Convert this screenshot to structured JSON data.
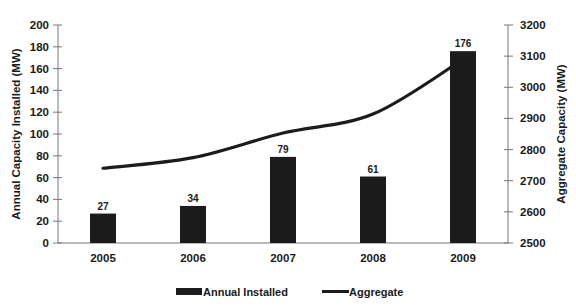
{
  "chart_data": {
    "type": "bar+line",
    "title": "",
    "categories": [
      "2005",
      "2006",
      "2007",
      "2008",
      "2009"
    ],
    "series": [
      {
        "name": "Annual Installed",
        "type": "bar",
        "axis": "left",
        "values": [
          27,
          34,
          79,
          61,
          176
        ],
        "data_labels": [
          "27",
          "34",
          "79",
          "61",
          "176"
        ],
        "color": "#1c1c1c"
      },
      {
        "name": "Aggregate",
        "type": "line",
        "axis": "right",
        "values": [
          2740,
          2774,
          2853,
          2914,
          3090
        ],
        "color": "#1c1c1c"
      }
    ],
    "xlabel": "",
    "ylabel": "Annual Capacity Installed (MW)",
    "y2label": "Aggregate Capacity (MW)",
    "ylim": [
      0,
      200
    ],
    "yticks": [
      0,
      20,
      40,
      60,
      80,
      100,
      120,
      140,
      160,
      180,
      200
    ],
    "y2lim": [
      2500,
      3200
    ],
    "y2ticks": [
      2500,
      2600,
      2700,
      2800,
      2900,
      3000,
      3100,
      3200
    ],
    "grid": false,
    "legend_position": "bottom",
    "legend": [
      "Annual Installed",
      "Aggregate"
    ]
  }
}
